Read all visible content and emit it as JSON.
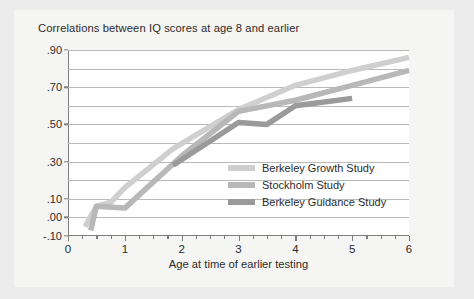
{
  "figure": {
    "title": "Correlations between IQ scores at age 8 and earlier",
    "background": "#ececec",
    "panel": "#f5f5f3",
    "plot_background": "#ffffff",
    "axis_color": "#7d7d7d",
    "grid_color": "#b9b9b9"
  },
  "chart_data": {
    "type": "line",
    "title": "Correlations between IQ scores at age 8 and earlier",
    "xlabel": "Age at time of earlier testing",
    "ylabel": "",
    "xlim": [
      0,
      6
    ],
    "ylim": [
      -0.1,
      0.9
    ],
    "grid": true,
    "legend_position": "center-right",
    "xticks": [
      0,
      1,
      2,
      3,
      4,
      5,
      6
    ],
    "xticklabels": [
      "0",
      "1",
      "2",
      "3",
      "4",
      "5",
      "6"
    ],
    "xminorticks": [
      0.25,
      0.5,
      0.75,
      1.25,
      1.5,
      1.75,
      2.25,
      2.5,
      2.75,
      3.25,
      3.5,
      3.75,
      4.25,
      4.5,
      4.75,
      5.25,
      5.5,
      5.75
    ],
    "yticks": [
      -0.1,
      0.0,
      0.1,
      0.2,
      0.3,
      0.4,
      0.5,
      0.6,
      0.7,
      0.8,
      0.9
    ],
    "ylabeled": [
      {
        "value": 0.9,
        "label": ".90"
      },
      {
        "value": 0.7,
        "label": ".70"
      },
      {
        "value": 0.5,
        "label": ".50"
      },
      {
        "value": 0.3,
        "label": ".30"
      },
      {
        "value": 0.1,
        "label": ".10"
      },
      {
        "value": 0.0,
        "label": ".00"
      },
      {
        "value": -0.1,
        "label": "-.10"
      }
    ],
    "series": [
      {
        "name": "Berkeley Growth Study",
        "color": "#cfcfcf",
        "points": [
          [
            0.3,
            -0.05
          ],
          [
            0.5,
            0.06
          ],
          [
            0.75,
            0.08
          ],
          [
            1.0,
            0.16
          ],
          [
            1.85,
            0.37
          ],
          [
            3.0,
            0.58
          ],
          [
            4.0,
            0.71
          ],
          [
            5.0,
            0.79
          ],
          [
            6.0,
            0.86
          ]
        ]
      },
      {
        "name": "Stockholm Study",
        "color": "#b8b8b8",
        "points": [
          [
            0.4,
            -0.07
          ],
          [
            0.5,
            0.06
          ],
          [
            1.0,
            0.05
          ],
          [
            2.0,
            0.33
          ],
          [
            3.0,
            0.57
          ],
          [
            4.0,
            0.63
          ],
          [
            5.0,
            0.71
          ],
          [
            6.0,
            0.79
          ]
        ]
      },
      {
        "name": "Berkeley Guidance Study",
        "color": "#9a9a9a",
        "points": [
          [
            1.85,
            0.28
          ],
          [
            3.0,
            0.51
          ],
          [
            3.5,
            0.5
          ],
          [
            4.0,
            0.6
          ],
          [
            5.0,
            0.64
          ]
        ]
      }
    ]
  }
}
